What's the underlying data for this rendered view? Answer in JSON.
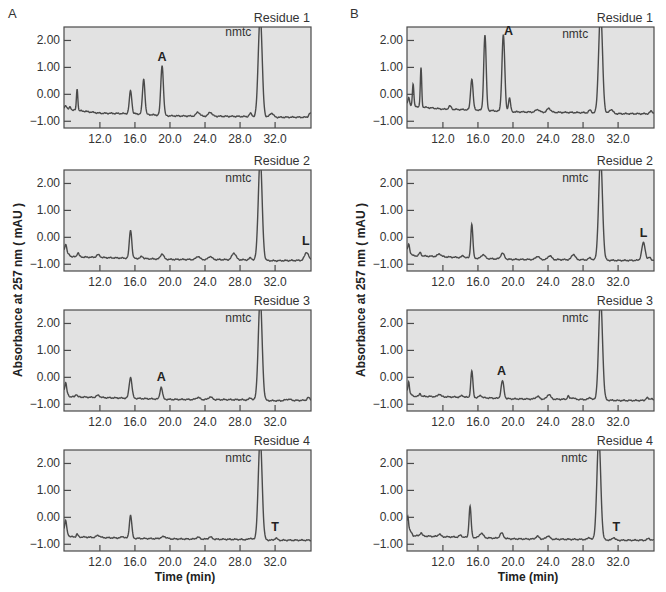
{
  "figure": {
    "panels": [
      {
        "letter": "A"
      },
      {
        "letter": "B"
      }
    ],
    "ylabel": "Absorbance at 257 nm ( mAU )",
    "xlabel": "Time (min)",
    "colors": {
      "plot_bg": "#e2e2e2",
      "frame": "#4a4a4a",
      "trace": "#4a4a4a",
      "text": "#333333"
    }
  },
  "chart_data": [
    {
      "type": "line",
      "panel": "A",
      "title": "Residue 1",
      "xlabel": "Time (min)",
      "ylabel": "Absorbance at 257 nm ( mAU )",
      "xticks": [
        "12.0",
        "16.0",
        "20.0",
        "24.0",
        "28.0",
        "32.0"
      ],
      "yticks": [
        "2.00",
        "1.00",
        "0.00",
        "−1.00"
      ],
      "xlim": [
        7.9,
        36.1
      ],
      "ylim": [
        -1.25,
        2.5
      ],
      "baseline": [
        [
          7.9,
          -0.55
        ],
        [
          9.5,
          -0.6
        ],
        [
          12,
          -0.7
        ],
        [
          16,
          -0.72
        ],
        [
          20,
          -0.8
        ],
        [
          28,
          -0.82
        ],
        [
          32,
          -0.85
        ],
        [
          36.1,
          -0.85
        ]
      ],
      "peaks": [
        [
          8.1,
          0.15,
          0.12
        ],
        [
          8.6,
          0.1,
          0.1
        ],
        [
          9.4,
          0.8,
          0.08
        ],
        [
          15.5,
          0.85,
          0.14
        ],
        [
          17.0,
          1.3,
          0.14
        ],
        [
          19.1,
          1.85,
          0.15
        ],
        [
          23.2,
          0.15,
          0.2
        ],
        [
          24.6,
          0.15,
          0.2
        ],
        [
          29.2,
          0.12,
          0.15
        ],
        [
          30.3,
          3.8,
          0.22
        ],
        [
          31.6,
          0.15,
          0.2
        ],
        [
          36.0,
          0.15,
          0.15
        ]
      ],
      "annotations": [
        {
          "text": "A",
          "x": 19.1,
          "y": 1.25,
          "bold": true
        },
        {
          "text": "nmtc",
          "x": 27.8,
          "y": 2.15,
          "bold": false
        }
      ]
    },
    {
      "type": "line",
      "panel": "A",
      "title": "Residue 2",
      "xlabel": "Time (min)",
      "ylabel": "Absorbance at 257 nm ( mAU )",
      "xticks": [
        "12.0",
        "16.0",
        "20.0",
        "24.0",
        "28.0",
        "32.0"
      ],
      "yticks": [
        "2.00",
        "1.00",
        "0.00",
        "−1.00"
      ],
      "xlim": [
        7.9,
        36.1
      ],
      "ylim": [
        -1.25,
        2.5
      ],
      "baseline": [
        [
          7.9,
          -0.5
        ],
        [
          8.8,
          -0.72
        ],
        [
          12,
          -0.75
        ],
        [
          16,
          -0.78
        ],
        [
          20,
          -0.82
        ],
        [
          28,
          -0.83
        ],
        [
          32,
          -0.87
        ],
        [
          36.1,
          -0.85
        ]
      ],
      "peaks": [
        [
          8.1,
          0.3,
          0.1
        ],
        [
          9.5,
          0.15,
          0.12
        ],
        [
          11.8,
          0.1,
          0.2
        ],
        [
          15.5,
          1.05,
          0.14
        ],
        [
          16.8,
          0.08,
          0.15
        ],
        [
          19.1,
          0.2,
          0.18
        ],
        [
          23.2,
          0.12,
          0.2
        ],
        [
          24.6,
          0.12,
          0.2
        ],
        [
          27.3,
          0.25,
          0.22
        ],
        [
          29.2,
          0.08,
          0.15
        ],
        [
          30.3,
          3.8,
          0.22
        ],
        [
          35.6,
          0.3,
          0.22
        ]
      ],
      "annotations": [
        {
          "text": "L",
          "x": 35.5,
          "y": -0.3,
          "bold": true
        },
        {
          "text": "nmtc",
          "x": 27.8,
          "y": 2.05,
          "bold": false
        }
      ]
    },
    {
      "type": "line",
      "panel": "A",
      "title": "Residue 3",
      "xlabel": "Time (min)",
      "ylabel": "Absorbance at 257 nm ( mAU )",
      "xticks": [
        "12.0",
        "16.0",
        "20.0",
        "24.0",
        "28.0",
        "32.0"
      ],
      "yticks": [
        "2.00",
        "1.00",
        "0.00",
        "−1.00"
      ],
      "xlim": [
        7.9,
        36.1
      ],
      "ylim": [
        -1.25,
        2.5
      ],
      "baseline": [
        [
          7.9,
          -0.5
        ],
        [
          8.6,
          -0.72
        ],
        [
          12,
          -0.75
        ],
        [
          16,
          -0.78
        ],
        [
          20,
          -0.82
        ],
        [
          28,
          -0.83
        ],
        [
          32,
          -0.87
        ],
        [
          36.1,
          -0.85
        ]
      ],
      "peaks": [
        [
          8.1,
          0.35,
          0.1
        ],
        [
          9.3,
          0.1,
          0.1
        ],
        [
          11.8,
          0.08,
          0.2
        ],
        [
          15.5,
          0.78,
          0.16
        ],
        [
          19.0,
          0.45,
          0.14
        ],
        [
          23.2,
          0.08,
          0.2
        ],
        [
          24.6,
          0.1,
          0.2
        ],
        [
          29.2,
          0.08,
          0.15
        ],
        [
          30.3,
          3.8,
          0.22
        ],
        [
          33.5,
          0.05,
          0.3
        ],
        [
          35.8,
          0.1,
          0.15
        ]
      ],
      "annotations": [
        {
          "text": "A",
          "x": 19.0,
          "y": -0.15,
          "bold": true
        },
        {
          "text": "nmtc",
          "x": 27.8,
          "y": 2.05,
          "bold": false
        }
      ]
    },
    {
      "type": "line",
      "panel": "A",
      "title": "Residue 4",
      "xlabel": "Time (min)",
      "ylabel": "Absorbance at 257 nm ( mAU )",
      "xticks": [
        "12.0",
        "16.0",
        "20.0",
        "24.0",
        "28.0",
        "32.0"
      ],
      "yticks": [
        "2.00",
        "1.00",
        "0.00",
        "−1.00"
      ],
      "xlim": [
        7.9,
        36.1
      ],
      "ylim": [
        -1.25,
        2.5
      ],
      "baseline": [
        [
          7.9,
          -0.45
        ],
        [
          8.6,
          -0.72
        ],
        [
          12,
          -0.75
        ],
        [
          16,
          -0.78
        ],
        [
          20,
          -0.8
        ],
        [
          28,
          -0.82
        ],
        [
          32,
          -0.85
        ],
        [
          36.1,
          -0.85
        ]
      ],
      "peaks": [
        [
          8.1,
          0.4,
          0.1
        ],
        [
          9.4,
          0.1,
          0.1
        ],
        [
          11.8,
          0.08,
          0.2
        ],
        [
          14.6,
          0.06,
          0.15
        ],
        [
          15.5,
          0.85,
          0.14
        ],
        [
          19.3,
          0.08,
          0.3
        ],
        [
          23.2,
          0.07,
          0.2
        ],
        [
          24.6,
          0.08,
          0.2
        ],
        [
          29.2,
          0.06,
          0.15
        ],
        [
          30.3,
          3.8,
          0.22
        ],
        [
          32.1,
          0.08,
          0.15
        ]
      ],
      "annotations": [
        {
          "text": "T",
          "x": 32.0,
          "y": -0.5,
          "bold": true
        },
        {
          "text": "nmtc",
          "x": 27.8,
          "y": 2.05,
          "bold": false
        }
      ]
    },
    {
      "type": "line",
      "panel": "B",
      "title": "Residue 1",
      "xlabel": "Time (min)",
      "ylabel": "Absorbance at 257 nm ( mAU )",
      "xticks": [
        "12.0",
        "16.0",
        "20.0",
        "24.0",
        "28.0",
        "32.0"
      ],
      "yticks": [
        "2.00",
        "1.00",
        "0.00",
        "−1.00"
      ],
      "xlim": [
        7.9,
        36.1
      ],
      "ylim": [
        -1.25,
        2.5
      ],
      "baseline": [
        [
          7.9,
          -0.35
        ],
        [
          9.0,
          -0.45
        ],
        [
          12,
          -0.55
        ],
        [
          16,
          -0.58
        ],
        [
          20,
          -0.65
        ],
        [
          28,
          -0.68
        ],
        [
          32,
          -0.72
        ],
        [
          36.1,
          -0.72
        ]
      ],
      "peaks": [
        [
          8.1,
          0.25,
          0.08
        ],
        [
          8.6,
          0.8,
          0.08
        ],
        [
          9.5,
          1.45,
          0.08
        ],
        [
          12.8,
          0.12,
          0.15
        ],
        [
          15.3,
          1.15,
          0.14
        ],
        [
          16.8,
          2.8,
          0.14
        ],
        [
          18.9,
          2.85,
          0.16
        ],
        [
          19.6,
          0.5,
          0.12
        ],
        [
          22.8,
          0.1,
          0.2
        ],
        [
          24.1,
          0.15,
          0.2
        ],
        [
          28.8,
          0.1,
          0.15
        ],
        [
          30.0,
          3.8,
          0.22
        ],
        [
          31.2,
          0.15,
          0.2
        ],
        [
          35.8,
          0.1,
          0.15
        ]
      ],
      "annotations": [
        {
          "text": "A",
          "x": 19.5,
          "y": 2.2,
          "bold": true
        },
        {
          "text": "nmtc",
          "x": 27.1,
          "y": 2.1,
          "bold": false
        }
      ]
    },
    {
      "type": "line",
      "panel": "B",
      "title": "Residue 2",
      "xlabel": "Time (min)",
      "ylabel": "Absorbance at 257 nm ( mAU )",
      "xticks": [
        "12.0",
        "16.0",
        "20.0",
        "24.0",
        "28.0",
        "32.0"
      ],
      "yticks": [
        "2.00",
        "1.00",
        "0.00",
        "−1.00"
      ],
      "xlim": [
        7.9,
        36.1
      ],
      "ylim": [
        -1.25,
        2.5
      ],
      "baseline": [
        [
          7.9,
          -0.5
        ],
        [
          8.6,
          -0.68
        ],
        [
          12,
          -0.72
        ],
        [
          16,
          -0.78
        ],
        [
          20,
          -0.82
        ],
        [
          28,
          -0.83
        ],
        [
          32,
          -0.86
        ],
        [
          36.1,
          -0.85
        ]
      ],
      "peaks": [
        [
          8.1,
          0.3,
          0.1
        ],
        [
          9.4,
          0.12,
          0.12
        ],
        [
          11.6,
          0.1,
          0.2
        ],
        [
          14.3,
          0.07,
          0.15
        ],
        [
          15.3,
          1.25,
          0.12
        ],
        [
          16.6,
          0.15,
          0.2
        ],
        [
          18.8,
          0.22,
          0.2
        ],
        [
          22.8,
          0.12,
          0.2
        ],
        [
          24.2,
          0.15,
          0.2
        ],
        [
          26.9,
          0.2,
          0.2
        ],
        [
          28.8,
          0.08,
          0.15
        ],
        [
          30.0,
          3.8,
          0.22
        ],
        [
          34.9,
          0.65,
          0.2
        ],
        [
          35.6,
          0.1,
          0.15
        ]
      ],
      "annotations": [
        {
          "text": "L",
          "x": 34.9,
          "y": 0.0,
          "bold": true
        },
        {
          "text": "nmtc",
          "x": 27.1,
          "y": 2.05,
          "bold": false
        }
      ]
    },
    {
      "type": "line",
      "panel": "B",
      "title": "Residue 3",
      "xlabel": "Time (min)",
      "ylabel": "Absorbance at 257 nm ( mAU )",
      "xticks": [
        "12.0",
        "16.0",
        "20.0",
        "24.0",
        "28.0",
        "32.0"
      ],
      "yticks": [
        "2.00",
        "1.00",
        "0.00",
        "−1.00"
      ],
      "xlim": [
        7.9,
        36.1
      ],
      "ylim": [
        -1.25,
        2.5
      ],
      "baseline": [
        [
          7.9,
          -0.5
        ],
        [
          8.6,
          -0.7
        ],
        [
          12,
          -0.72
        ],
        [
          16,
          -0.75
        ],
        [
          20,
          -0.8
        ],
        [
          28,
          -0.82
        ],
        [
          32,
          -0.86
        ],
        [
          36.1,
          -0.86
        ]
      ],
      "peaks": [
        [
          8.1,
          0.4,
          0.08
        ],
        [
          9.4,
          0.1,
          0.1
        ],
        [
          11.6,
          0.1,
          0.15
        ],
        [
          14.2,
          0.06,
          0.15
        ],
        [
          15.3,
          0.98,
          0.12
        ],
        [
          16.3,
          0.08,
          0.15
        ],
        [
          18.8,
          0.65,
          0.16
        ],
        [
          22.8,
          0.1,
          0.2
        ],
        [
          24.1,
          0.18,
          0.2
        ],
        [
          26.3,
          0.12,
          0.1
        ],
        [
          26.8,
          0.06,
          0.2
        ],
        [
          28.8,
          0.08,
          0.15
        ],
        [
          30.0,
          3.8,
          0.22
        ],
        [
          35.3,
          0.1,
          0.15
        ],
        [
          35.8,
          0.08,
          0.15
        ]
      ],
      "annotations": [
        {
          "text": "A",
          "x": 18.7,
          "y": 0.1,
          "bold": true
        },
        {
          "text": "nmtc",
          "x": 27.1,
          "y": 2.05,
          "bold": false
        }
      ]
    },
    {
      "type": "line",
      "panel": "B",
      "title": "Residue 4",
      "xlabel": "Time (min)",
      "ylabel": "Absorbance at 257 nm ( mAU )",
      "xticks": [
        "12.0",
        "16.0",
        "20.0",
        "24.0",
        "28.0",
        "32.0"
      ],
      "yticks": [
        "2.00",
        "1.00",
        "0.00",
        "−1.00"
      ],
      "xlim": [
        7.9,
        36.1
      ],
      "ylim": [
        -1.25,
        2.5
      ],
      "baseline": [
        [
          7.9,
          -0.3
        ],
        [
          8.6,
          -0.68
        ],
        [
          12,
          -0.72
        ],
        [
          16,
          -0.75
        ],
        [
          20,
          -0.8
        ],
        [
          28,
          -0.82
        ],
        [
          32,
          -0.85
        ],
        [
          36.1,
          -0.85
        ]
      ],
      "peaks": [
        [
          8.0,
          0.4,
          0.08
        ],
        [
          9.5,
          0.12,
          0.12
        ],
        [
          11.6,
          0.1,
          0.15
        ],
        [
          14.0,
          0.07,
          0.15
        ],
        [
          15.1,
          1.15,
          0.12
        ],
        [
          16.4,
          0.17,
          0.2
        ],
        [
          18.7,
          0.2,
          0.2
        ],
        [
          22.8,
          0.1,
          0.2
        ],
        [
          24.0,
          0.12,
          0.2
        ],
        [
          28.7,
          0.08,
          0.15
        ],
        [
          29.8,
          3.8,
          0.22
        ],
        [
          31.5,
          0.1,
          0.15
        ],
        [
          35.5,
          0.07,
          0.15
        ]
      ],
      "annotations": [
        {
          "text": "T",
          "x": 31.8,
          "y": -0.5,
          "bold": true
        },
        {
          "text": "nmtc",
          "x": 27.0,
          "y": 2.05,
          "bold": false
        }
      ]
    }
  ]
}
